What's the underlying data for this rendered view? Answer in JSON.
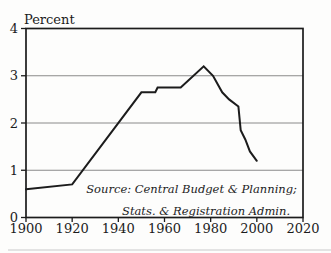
{
  "figure": {
    "background": "#fdfdfc",
    "ink_color": "#1c1c1c",
    "grid_color": "#8a8a8a",
    "bottom_rule_color": "#c9c9c9"
  },
  "chart_data": {
    "type": "line",
    "title": "",
    "ylabel": "Percent",
    "xlabel": "",
    "xlim": [
      1900,
      2020
    ],
    "ylim": [
      0,
      4
    ],
    "x_ticks": [
      1900,
      1920,
      1940,
      1960,
      1980,
      2000,
      2020
    ],
    "y_ticks": [
      0,
      1,
      2,
      3,
      4
    ],
    "grid": "horizontal",
    "legend": "none",
    "series": [
      {
        "name": "percent-growth-rate",
        "points": [
          [
            1900,
            0.6
          ],
          [
            1920,
            0.7
          ],
          [
            1950,
            2.65
          ],
          [
            1956,
            2.65
          ],
          [
            1957,
            2.75
          ],
          [
            1967,
            2.75
          ],
          [
            1977,
            3.2
          ],
          [
            1981,
            3.0
          ],
          [
            1985,
            2.65
          ],
          [
            1988,
            2.5
          ],
          [
            1992,
            2.35
          ],
          [
            1993,
            1.85
          ],
          [
            1995,
            1.65
          ],
          [
            1997,
            1.4
          ],
          [
            2000,
            1.2
          ]
        ]
      }
    ],
    "annotations": {
      "source_line1": "Source: Central Budget & Planning;",
      "source_line2": "Stats. & Registration Admin."
    }
  }
}
